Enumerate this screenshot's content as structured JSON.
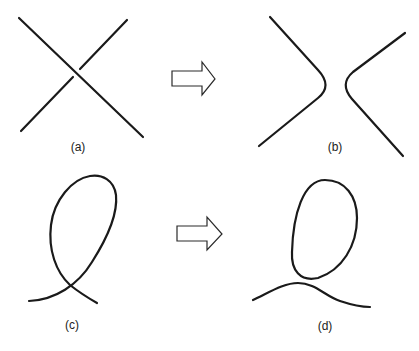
{
  "diagram": {
    "panels": [
      {
        "id": "a",
        "label": "(a)",
        "content": "two straight strands crossing (X)"
      },
      {
        "id": "b",
        "label": "(b)",
        "content": "crossing smoothed into two separated arcs )("
      },
      {
        "id": "c",
        "label": "(c)",
        "content": "single strand forming a loop with a self-crossing"
      },
      {
        "id": "d",
        "label": "(d)",
        "content": "crossing smoothed into a closed oval and a separate arc"
      }
    ],
    "arrows": [
      {
        "from": "a",
        "to": "b",
        "style": "hollow-right-arrow"
      },
      {
        "from": "c",
        "to": "d",
        "style": "hollow-right-arrow"
      }
    ],
    "colors": {
      "stroke": "#1a1a1a",
      "background": "#ffffff"
    }
  }
}
